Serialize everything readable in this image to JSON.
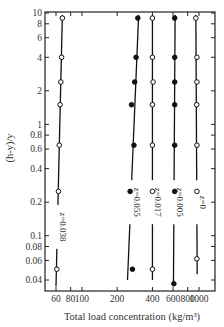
{
  "chart_data": {
    "type": "scatter",
    "title": "",
    "xlabel": "Total load concentration (kg/m³)",
    "ylabel": "(h-y)/y",
    "xscale": "log",
    "yscale": "log",
    "xlim": [
      50,
      1200
    ],
    "ylim": [
      0.03,
      10
    ],
    "x_ticks": [
      60,
      80,
      100,
      200,
      400,
      600,
      800,
      1000
    ],
    "x_tick_labels": [
      "60",
      "80",
      "100",
      "200",
      "400",
      "600",
      "800",
      "1000"
    ],
    "y_ticks": [
      0.04,
      0.06,
      0.08,
      0.1,
      0.2,
      0.4,
      0.6,
      0.8,
      1,
      2,
      4,
      6,
      8,
      10
    ],
    "y_tick_labels": [
      "0.04",
      "0.06",
      "0.08",
      "0.1",
      "0.2",
      "0.4",
      "0.6",
      "0.8",
      "1",
      "2",
      "4",
      "6",
      "8",
      "10"
    ],
    "grid": false,
    "legend": "inline labels along each line",
    "series": [
      {
        "name": "z=0.038",
        "marker": "open-circle",
        "points": [
          [
            68,
            9
          ],
          [
            67,
            4
          ],
          [
            66,
            2.4
          ],
          [
            65,
            1.5
          ],
          [
            64,
            0.65
          ],
          [
            63,
            0.25
          ],
          [
            61,
            0.05
          ]
        ],
        "line": [
          [
            68,
            9.6
          ],
          [
            60,
            0.035
          ]
        ]
      },
      {
        "name": "z=0.055",
        "marker": "filled-circle",
        "points": [
          [
            300,
            9
          ],
          [
            290,
            4
          ],
          [
            282,
            2.4
          ],
          [
            265,
            1.5
          ],
          [
            278,
            0.65
          ],
          [
            258,
            0.25
          ],
          [
            270,
            0.05
          ]
        ],
        "line": [
          [
            305,
            9.6
          ],
          [
            245,
            0.04
          ]
        ]
      },
      {
        "name": "z=0.017",
        "marker": "open-circle",
        "points": [
          [
            400,
            9
          ],
          [
            400,
            4
          ],
          [
            405,
            2.4
          ],
          [
            400,
            1.5
          ],
          [
            400,
            0.65
          ],
          [
            400,
            0.25
          ],
          [
            400,
            0.05
          ]
        ],
        "line": [
          [
            400,
            9.6
          ],
          [
            400,
            0.04
          ]
        ]
      },
      {
        "name": "z=0.005",
        "marker": "filled-circle",
        "points": [
          [
            620,
            9
          ],
          [
            620,
            4
          ],
          [
            620,
            2.4
          ],
          [
            620,
            1.5
          ],
          [
            620,
            0.65
          ],
          [
            620,
            0.25
          ],
          [
            610,
            0.037
          ]
        ],
        "line": [
          [
            625,
            9.6
          ],
          [
            605,
            0.038
          ]
        ]
      },
      {
        "name": "z=0",
        "marker": "open-circle",
        "points": [
          [
            940,
            9
          ],
          [
            960,
            4
          ],
          [
            960,
            2.4
          ],
          [
            955,
            1.5
          ],
          [
            960,
            0.65
          ],
          [
            960,
            0.25
          ],
          [
            960,
            0.062
          ]
        ],
        "line": [
          [
            940,
            9.6
          ],
          [
            965,
            0.045
          ]
        ]
      }
    ]
  }
}
